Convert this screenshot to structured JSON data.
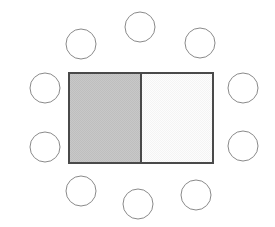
{
  "diagram": {
    "canvas": {
      "width": 275,
      "height": 227,
      "background": "#ffffff"
    },
    "table": {
      "label": "rectangular-table",
      "x": 68,
      "y": 72,
      "width": 146,
      "height": 92,
      "border_color": "#4a4a4a",
      "border_width": 2,
      "divider_x": 141,
      "divider_color": "#4a4a4a",
      "divider_width": 2,
      "halves": [
        {
          "label": "shaded-half",
          "side": "left",
          "fill": "#c6c6c6",
          "shaded": true
        },
        {
          "label": "plain-half",
          "side": "right",
          "fill": "#fafafa",
          "shaded": false
        }
      ]
    },
    "chairs": {
      "label": "chair-circles",
      "count": 10,
      "radius": 15,
      "fill": "#ffffff",
      "stroke": "#8a8a8a",
      "stroke_width": 1,
      "items": [
        {
          "name": "chair-top-left",
          "side": "top",
          "cx": 81,
          "cy": 44
        },
        {
          "name": "chair-top-center",
          "side": "top",
          "cx": 140,
          "cy": 27
        },
        {
          "name": "chair-top-right",
          "side": "top",
          "cx": 200,
          "cy": 43
        },
        {
          "name": "chair-left-upper",
          "side": "left",
          "cx": 45,
          "cy": 88
        },
        {
          "name": "chair-left-lower",
          "side": "left",
          "cx": 45,
          "cy": 147
        },
        {
          "name": "chair-right-upper",
          "side": "right",
          "cx": 243,
          "cy": 88
        },
        {
          "name": "chair-right-lower",
          "side": "right",
          "cx": 243,
          "cy": 146
        },
        {
          "name": "chair-bottom-left",
          "side": "bottom",
          "cx": 81,
          "cy": 191
        },
        {
          "name": "chair-bottom-center",
          "side": "bottom",
          "cx": 138,
          "cy": 204
        },
        {
          "name": "chair-bottom-right",
          "side": "bottom",
          "cx": 196,
          "cy": 195
        }
      ]
    }
  }
}
